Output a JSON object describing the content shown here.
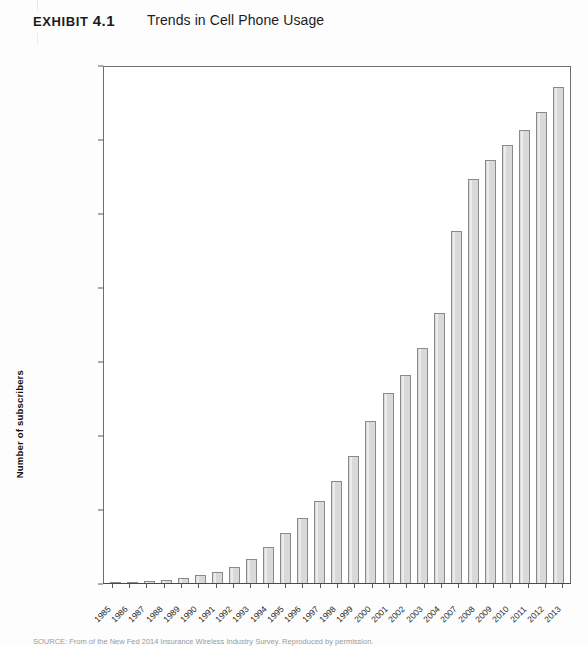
{
  "header": {
    "exhibit_label": "Exhibit",
    "exhibit_number": "4.1",
    "title": "Trends in Cell Phone Usage"
  },
  "source_note": "SOURCE: From of the New Fed 2014 Insurance Wireless Industry Survey. Reproduced by permission.",
  "colors": {
    "bar_fill": "#d9d9d9",
    "bar_border": "#8a8a8a",
    "axis": "#5a5a5a",
    "text": "#1f1f1f",
    "page_background": "#fdfdfd"
  },
  "chart_data": {
    "type": "bar",
    "title": "Trends in Cell Phone Usage",
    "xlabel": "Year",
    "ylabel": "Number of subscribers",
    "ylim": [
      0,
      350000000
    ],
    "ytick_values": [
      0,
      50000000,
      100000000,
      150000000,
      200000000,
      250000000,
      300000000,
      350000000
    ],
    "ytick_labels": [
      "0",
      "50,000,000",
      "100,000,000",
      "150,000,000",
      "200,000,000",
      "250,000,000",
      "300,000,000",
      "350,000,000"
    ],
    "grid": false,
    "legend": null,
    "categories": [
      "1985",
      "1986",
      "1987",
      "1988",
      "1989",
      "1990",
      "1991",
      "1992",
      "1993",
      "1994",
      "1995",
      "1996",
      "1997",
      "1998",
      "1999",
      "2000",
      "2001",
      "2002",
      "2003",
      "2004",
      "2007",
      "2008",
      "2009",
      "2010",
      "2011",
      "2012",
      "2013"
    ],
    "values": [
      340213,
      681825,
      1230855,
      2069441,
      3508944,
      5283055,
      7557148,
      11032753,
      16009461,
      24134421,
      33785661,
      44042992,
      55312293,
      69209321,
      86047003,
      109478031,
      128374512,
      140766842,
      158721981,
      182140362,
      238000000,
      273000000,
      286000000,
      296000000,
      306000000,
      318000000,
      335000000
    ],
    "value_labels_visible": false
  }
}
